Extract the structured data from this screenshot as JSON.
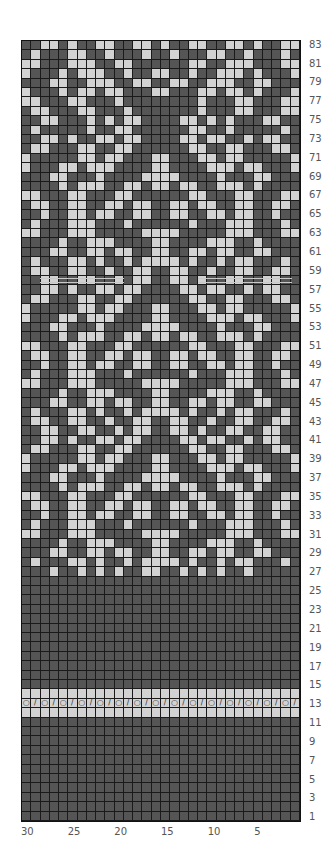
{
  "chart_data": {
    "type": "heatmap",
    "title": "",
    "columns": 30,
    "rows": 83,
    "xlabel": "",
    "ylabel": "",
    "x_tick_labels": [
      "30",
      "25",
      "20",
      "15",
      "10",
      "5"
    ],
    "y_tick_labels": [
      "83",
      "81",
      "79",
      "77",
      "75",
      "73",
      "71",
      "69",
      "67",
      "65",
      "63",
      "61",
      "59",
      "57",
      "55",
      "53",
      "51",
      "49",
      "47",
      "45",
      "43",
      "41",
      "39",
      "37",
      "35",
      "33",
      "31",
      "29",
      "27",
      "25",
      "23",
      "21",
      "19",
      "17",
      "15",
      "13",
      "11",
      "9",
      "7",
      "5",
      "3",
      "1"
    ],
    "legend": {
      "D": "#555555",
      "L": "#d2d2d2"
    },
    "grid_rows_top_to_bottom": [
      "DDLLDLDDLLDDLLDLDDLLDDLLDLDDLL",
      "DLDDDLLDDLDDDLDDLDDDLLDDLDDDLD",
      "LLDDDLLLDDLLDDDDDDLLDDLLLDDDLL",
      "LDDDLDLLLDDLDDLLDDLDDLLLDLDDDL",
      "DDDLLDDLLLDDLLDDLLDDLLLDDLLDDD",
      "LDDDLDLLDLLDDDLLDDDLLDLLDLDDDL",
      "LLDDDLLDDDLDDDDDDDDLDDDLLDDDLL",
      "DLLDDDLLDDDLDDDDDDDLDDDLLDDDLLD",
      "DDLLDDDLDLDLLDDDDLLDLDLDDDLLDD",
      "DLDDDDDLDDLLDDDDDDLLDDLDDDDDLD",
      "DDLLDLDDLLDLLDDDDLLDLLDDLDLLDD",
      "DLLDDDLLDDLLDDDDDDLLDDLLDDDLLD",
      "LDDDDDLLDLLDDDLLDDDLLDLLDDDDDL",
      "LDDDLLDLLLDDDDLLDDDDLLLDLLDDDL",
      "DDDLLDDDLDDDDLLLLDDDDLDDDLLDDD",
      "DDDDLDLLLDDLLDLLDLLDDLLLDLDDDD",
      "LLDDDLLDDDLLDDDDDDLLDDDLLDDDLL",
      "DLLDDLLDDLLDLLDDLLDLLDDLLDDLLD",
      "DDLDDLLDLLDDLLDDLLDDLLDLLDDLDD",
      "DLDDDLLLDDDLDDDDDDLDDDLLLDDDLD",
      "LLDDDLLLDDDDDLLLLDDDDDLLLDDDLL",
      "DDDDLDDLLLDDDDLLDDDDLLLDDLDDDD",
      "DDDLLDDLLDLLDDLLDDLLDLLDDLLDDD",
      "DLDDDLLDLDDLDLLLLDLDDLDLLDDDLD",
      "DLLDDLLDDLDDLLDDLLDDLDDLLDDLLD",
      "DDLLDDLLDDLDLLDDLLDLDDLLDDLLDD",
      "DDLLDLDDLLDLLDDDDLLDLLDDLDLLDD",
      "DLLDDDLLDDLLDDDDDDLLDDLLDDDLLD",
      "LDDDDDLLDLLDDDLLDDDLLDLLDDDDDL",
      "LDDDLLDLLLDDDDLLDDDDLLLDLLDDDL",
      "DDDLLDDDLDDDDLLLLDDDDLDDDLLDDD",
      "DDDDLDLLLDDLLDLLDLLDDLLLDLDDDD",
      "LLDDDLLDDDLLDDDDDDLLDDDLLDDDLL",
      "DLLDDLLDDLLDLLDDLLDLLDDLLDDLLD",
      "DDLDDLLDLLDDLLDDLLDDLLDLLDDLDD",
      "DLDDDLLLDDDLDDDDDDLDDDLLLDDDLD",
      "LLDDDLLLDDDDDLLLLDDDDDLLLDDDLL",
      "DDDDLDDLLLDDDDLLDDDDLLLDDLDDDD",
      "DDDLLDDLLDLLDDLLDDLLDLLDDLLDDD",
      "DLDDDLLDLDDLDLLLLDLDDLDLLDDDLD",
      "DLLDDLLDDLDDLLDDLLDDLDDLLDDLLD",
      "DDLLDDLLDDLDLLDDLLDLDDLLDDLLDD",
      "DDLLDLDDLLDLLDDDDLLDLLDDLDLLDD",
      "DLLDDDLLDDLLDDDDDDLLDDLLDDDLLD",
      "LDDDDDLLDLLDDDLLDDDLLDLLDDDDDL",
      "LDDDLLDLLLDDDDLLDDDDLLLDLLDDDL",
      "DDDLLDDDLDDDDLLLLDDDDLDDDLLDDD",
      "DDDDLDLLLDDLLDLLDLLDDLLLDLDDDD",
      "LLDDDLLDDDLLDDDDDDLLDDDLLDDDLL",
      "DLLDDLLDDLLDLLDDLLDLLDDLLDDLLD",
      "DDLDDLLDLLDDLLDDLLDDLLDLLDDLDD",
      "DLDDDLLLDDDLDDDDDDLDDDLLLDDDLD",
      "LLDDDLLLDDDDDLLLLDDDDDLLLDDDLL",
      "DDDDLDDLLLDDDDLLDDDDLLLDDLDDDD",
      "DDDLLDDLLDLLDDLLDDLLDLLDDLLDDD",
      "DLDDDLLDLDDLDLLLLDLDDLDLLDDDLD",
      "DDDLDDLDLDLDDLLDDLDLDLDDLDDDDD",
      "DDDDDDDDDDDDDDDDDDDDDDDDDDDDDD",
      "DDDDDDDDDDDDDDDDDDDDDDDDDDDDDD",
      "DDDDDDDDDDDDDDDDDDDDDDDDDDDDDD",
      "DDDDDDDDDDDDDDDDDDDDDDDDDDDDDD",
      "DDDDDDDDDDDDDDDDDDDDDDDDDDDDDD",
      "DDDDDDDDDDDDDDDDDDDDDDDDDDDDDD",
      "DDDDDDDDDDDDDDDDDDDDDDDDDDDDDD",
      "DDDDDDDDDDDDDDDDDDDDDDDDDDDDDD",
      "DDDDDDDDDDDDDDDDDDDDDDDDDDDDDD",
      "DDDDDDDDDDDDDDDDDDDDDDDDDDDDDD",
      "DDDDDDDDDDDDDDDDDDDDDDDDDDDDDD",
      "DDDDDDDDDDDDDDDDDDDDDDDDDDDDDD",
      "LLLLLLLLLLLLLLLLLLLLLLLLLLLLLL",
      "O/O/O/O/O/O/O/O/O/O/O/O/O/O/O/",
      "LLLLLLLLLLLLLLLLLLLLLLLLLLLLLL",
      "DDDDDDDDDDDDDDDDDDDDDDDDDDDDDD",
      "DDDDDDDDDDDDDDDDDDDDDDDDDDDDDD",
      "DDDDDDDDDDDDDDDDDDDDDDDDDDDDDD",
      "DDDDDDDDDDDDDDDDDDDDDDDDDDDDDD",
      "DDDDDDDDDDDDDDDDDDDDDDDDDDDDDD",
      "DDDDDDDDDDDDDDDDDDDDDDDDDDDDDD",
      "DDDDDDDDDDDDDDDDDDDDDDDDDDDDDD",
      "DDDDDDDDDDDDDDDDDDDDDDDDDDDDDD",
      "DDDDDDDDDDDDDDDDDDDDDDDDDDDDDD",
      "DDDDDDDDDDDDDDDDDDDDDDDDDDDDDD",
      "DDDDDDDDDDDDDDDDDDDDDDDDDDDDDD"
    ],
    "symbol_row": {
      "row": 13,
      "symbols": {
        "O": "yarn-over",
        "/": "k2tog"
      }
    },
    "marker_lines": [
      {
        "row": 58,
        "from_col": 28,
        "to_col": 20
      },
      {
        "row": 58,
        "from_col": 11,
        "to_col": 2
      }
    ],
    "grid": true
  }
}
